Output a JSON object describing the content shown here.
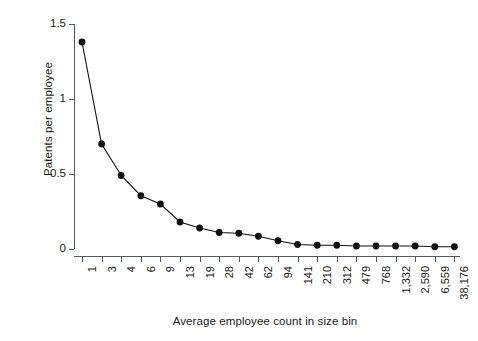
{
  "chart_data": {
    "type": "line",
    "title": "",
    "xlabel": "Average employee count in size bin",
    "ylabel": "Patents per employee",
    "categories": [
      "1",
      "3",
      "4",
      "6",
      "9",
      "13",
      "19",
      "28",
      "42",
      "62",
      "94",
      "141",
      "210",
      "312",
      "479",
      "768",
      "1,332",
      "2,590",
      "6,559",
      "38,176"
    ],
    "values": [
      1.38,
      0.7,
      0.49,
      0.355,
      0.3,
      0.18,
      0.14,
      0.11,
      0.105,
      0.085,
      0.055,
      0.03,
      0.025,
      0.025,
      0.02,
      0.02,
      0.02,
      0.02,
      0.015,
      0.015
    ],
    "yticks": [
      "0",
      "0.5",
      "1",
      "1.5"
    ],
    "ytickvalues": [
      0,
      0.5,
      1,
      1.5
    ],
    "ylim": [
      0,
      1.5
    ],
    "grid": false,
    "legend": "none",
    "marker": "filled-circle",
    "line_color": "#101010",
    "marker_color": "#101010",
    "axis_color": "#555a5e",
    "background": "#ffffff"
  }
}
